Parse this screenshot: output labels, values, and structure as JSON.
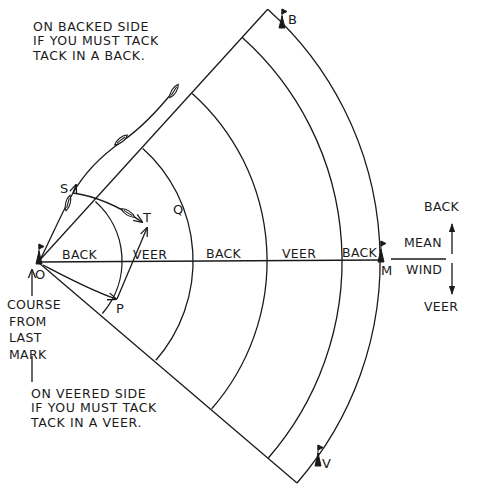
{
  "diagram": {
    "title": "",
    "notes": {
      "backed_side": [
        "ON BACKED SIDE",
        "IF YOU MUST TACK",
        "TACK IN A BACK."
      ],
      "veered_side": [
        "ON VEERED SIDE",
        "IF YOU MUST TACK",
        "TACK IN A VEER."
      ]
    },
    "course_label": [
      "COURSE",
      "FROM",
      "LAST",
      "MARK"
    ],
    "points": {
      "O": "O",
      "S": "S",
      "T": "T",
      "Q": "Q",
      "P": "P",
      "M": "M",
      "B": "B",
      "V": "V"
    },
    "sector_labels": [
      "BACK",
      "VEER",
      "BACK",
      "VEER",
      "BACK"
    ],
    "wind": {
      "label_top": "MEAN",
      "label_bottom": "WIND",
      "back_label": "BACK",
      "veer_label": "VEER"
    },
    "marks": [
      {
        "id": "O",
        "description": "start mark flag"
      },
      {
        "id": "M",
        "description": "windward mark flag"
      },
      {
        "id": "B",
        "description": "layline mark flag backed side"
      },
      {
        "id": "V",
        "description": "layline mark flag veered side"
      }
    ],
    "colors": {
      "ink": "#1a1a1a",
      "background": "#ffffff"
    }
  }
}
